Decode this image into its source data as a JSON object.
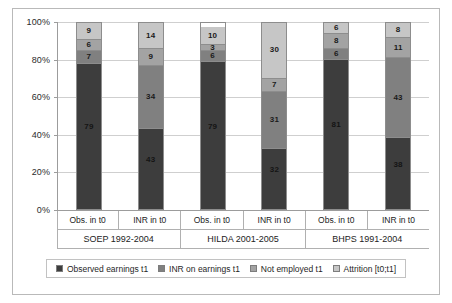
{
  "chart_data": {
    "type": "bar",
    "stacked": true,
    "title": "",
    "subtitle": "",
    "xlabel": "",
    "ylabel": "",
    "ylim": [
      0,
      100
    ],
    "grid": true,
    "legend_position": "bottom",
    "ytick_labels": [
      "100%",
      "80%",
      "60%",
      "40%",
      "20%",
      "0%"
    ],
    "ytick_values": [
      100,
      80,
      60,
      40,
      20,
      0
    ],
    "categories": [
      "Obs. in t0",
      "INR in t0",
      "Obs. in t0",
      "INR in t0",
      "Obs. in t0",
      "INR in t0"
    ],
    "groups": [
      {
        "label": "SOEP 1992-2004",
        "categories": [
          "Obs. in t0",
          "INR in t0"
        ]
      },
      {
        "label": "HILDA 2001-2005",
        "categories": [
          "Obs. in t0",
          "INR in t0"
        ]
      },
      {
        "label": "BHPS 1991-2004",
        "categories": [
          "Obs. in t0",
          "INR in t0"
        ]
      }
    ],
    "series": [
      {
        "name": "Observed earnings t1",
        "color": "#3d3d3d",
        "values": [
          79,
          43,
          79,
          32,
          81,
          38
        ]
      },
      {
        "name": "INR on earnings t1",
        "color": "#808080",
        "values": [
          7,
          34,
          6,
          31,
          6,
          43
        ]
      },
      {
        "name": "Not employed t1",
        "color": "#a3a3a3",
        "values": [
          6,
          9,
          3,
          7,
          8,
          11
        ]
      },
      {
        "name": "Attrition [t0;t1]",
        "color": "#c6c6c6",
        "values": [
          9,
          14,
          10,
          30,
          6,
          8
        ]
      }
    ],
    "bars": [
      {
        "group": "SOEP 1992-2004",
        "category": "Obs. in t0",
        "segments": [
          79,
          7,
          6,
          9
        ]
      },
      {
        "group": "SOEP 1992-2004",
        "category": "INR in t0",
        "segments": [
          43,
          34,
          9,
          14
        ]
      },
      {
        "group": "HILDA 2001-2005",
        "category": "Obs. in t0",
        "segments": [
          79,
          6,
          3,
          10
        ]
      },
      {
        "group": "HILDA 2001-2005",
        "category": "INR in t0",
        "segments": [
          32,
          31,
          7,
          30
        ]
      },
      {
        "group": "BHPS 1991-2004",
        "category": "Obs. in t0",
        "segments": [
          81,
          6,
          8,
          6
        ]
      },
      {
        "group": "BHPS 1991-2004",
        "category": "INR in t0",
        "segments": [
          38,
          43,
          11,
          8
        ]
      }
    ]
  },
  "legend": {
    "items": [
      {
        "label": "Observed earnings t1",
        "color": "#3d3d3d"
      },
      {
        "label": "INR on earnings t1",
        "color": "#808080"
      },
      {
        "label": "Not employed t1",
        "color": "#a3a3a3"
      },
      {
        "label": "Attrition [t0;t1]",
        "color": "#c6c6c6"
      }
    ]
  }
}
